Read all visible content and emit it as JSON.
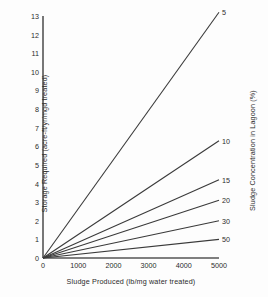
{
  "chart_data": {
    "type": "line",
    "title": "",
    "xlabel": "Sludge Produced (lb/mg water treated)",
    "ylabel": "Storage Required (acre-ft/yr/mgd treated)",
    "right_axis_label": "Sludge Concentration in Lagoon (%)",
    "xlim": [
      0,
      5000
    ],
    "ylim": [
      0,
      13
    ],
    "xticks": [
      0,
      1000,
      2000,
      3000,
      4000,
      5000
    ],
    "xtick_labels": [
      "0",
      "1000",
      "2000",
      "3000",
      "4000",
      "5000"
    ],
    "yticks": [
      0,
      1,
      2,
      3,
      4,
      5,
      6,
      7,
      8,
      9,
      10,
      11,
      12,
      13
    ],
    "ytick_labels": [
      "0",
      "1",
      "2",
      "3",
      "4",
      "5",
      "6",
      "7",
      "8",
      "9",
      "10",
      "11",
      "12",
      "13"
    ],
    "grid": false,
    "legend_position": "line-end-labels",
    "line_color": "#3a3a3a",
    "axis_color": "#555555",
    "series": [
      {
        "name": "5",
        "label": "5",
        "x": [
          0,
          5000
        ],
        "values": [
          0,
          13.2
        ]
      },
      {
        "name": "10",
        "label": "10",
        "x": [
          0,
          5000
        ],
        "values": [
          0,
          6.3
        ]
      },
      {
        "name": "15",
        "label": "15",
        "x": [
          0,
          5000
        ],
        "values": [
          0,
          4.2
        ]
      },
      {
        "name": "20",
        "label": "20",
        "x": [
          0,
          5000
        ],
        "values": [
          0,
          3.1
        ]
      },
      {
        "name": "30",
        "label": "30",
        "x": [
          0,
          5000
        ],
        "values": [
          0,
          2.0
        ]
      },
      {
        "name": "50",
        "label": "50",
        "x": [
          0,
          5000
        ],
        "values": [
          0,
          1.0
        ]
      }
    ]
  }
}
